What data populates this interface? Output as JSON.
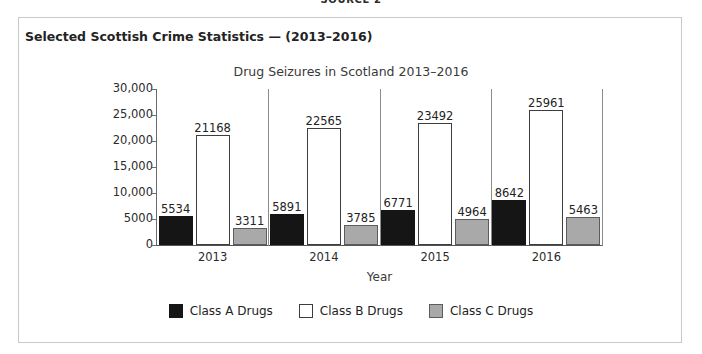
{
  "page": {
    "source_label": "SOURCE 2"
  },
  "card": {
    "title": "Selected Scottish Crime Statistics — (2013–2016)"
  },
  "chart_data": {
    "type": "bar",
    "title": "Drug Seizures in Scotland 2013–2016",
    "xlabel": "Year",
    "ylabel": "",
    "categories": [
      "2013",
      "2014",
      "2015",
      "2016"
    ],
    "series": [
      {
        "name": "Class A Drugs",
        "color": "#151515",
        "values": [
          5534,
          5891,
          6771,
          8642
        ]
      },
      {
        "name": "Class B Drugs",
        "color": "#ffffff",
        "values": [
          21168,
          22565,
          23492,
          25961
        ]
      },
      {
        "name": "Class C Drugs",
        "color": "#a9a9a9",
        "values": [
          3311,
          3785,
          4964,
          5463
        ]
      }
    ],
    "ylim": [
      0,
      30000
    ],
    "ytick_labels": [
      "30,000",
      "25,000",
      "20,000",
      "15,000",
      "10,000",
      "5000",
      "0"
    ],
    "ytick_values": [
      30000,
      25000,
      20000,
      15000,
      10000,
      5000,
      0
    ],
    "grid": false,
    "group_separators": true,
    "data_labels": true,
    "legend_position": "bottom"
  }
}
